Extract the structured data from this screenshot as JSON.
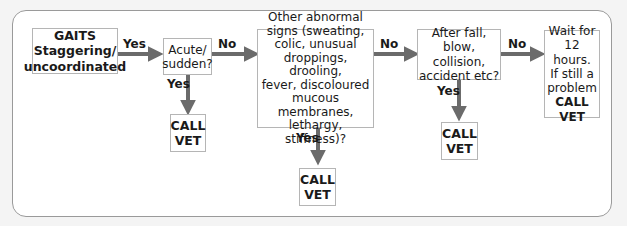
{
  "nodes": {
    "start": {
      "title": "GAITS",
      "line1": "Staggering/",
      "line2": "uncoordinated"
    },
    "q1": {
      "line1": "Acute/",
      "line2": "sudden?"
    },
    "q2": {
      "lines": [
        "Other abnormal",
        "signs (sweating,",
        "colic, unusual",
        "droppings, drooling,",
        "fever, discoloured",
        "mucous membranes,",
        "lethargy, stiffness)?"
      ]
    },
    "q3": {
      "lines": [
        "After fall,",
        "blow, collision,",
        "accident etc?"
      ]
    },
    "end_wait": {
      "lines": [
        "Wait for",
        "12 hours.",
        "If still a",
        "problem"
      ],
      "action1": "CALL",
      "action2": "VET"
    },
    "vet1": {
      "line1": "CALL",
      "line2": "VET"
    },
    "vet2": {
      "line1": "CALL",
      "line2": "VET"
    },
    "vet3": {
      "line1": "CALL",
      "line2": "VET"
    }
  },
  "edges": {
    "start_q1": "Yes",
    "q1_q2": "No",
    "q1_vet": "Yes",
    "q2_q3": "No",
    "q2_vet": "Yes",
    "q3_wait": "No",
    "q3_vet": "Yes"
  },
  "colors": {
    "arrow": "#6b6b6b",
    "box_border": "#b5b5b5",
    "frame_border": "#9a9a9a"
  }
}
